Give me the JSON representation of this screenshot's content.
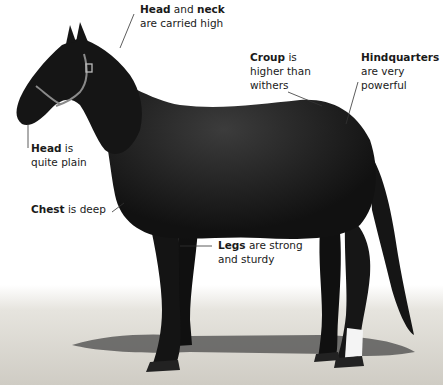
{
  "diagram": {
    "colors": {
      "background": "#ffffff",
      "horse": "#141414",
      "horse_highlight": "#3a3a3a",
      "ground": "#d8d6d0",
      "shadow": "#4a4a4a",
      "text": "#1a1a1a",
      "leader_line": "#333333",
      "white_sock": "#f4f4f4"
    },
    "labels": [
      {
        "id": "head-neck",
        "bold1": "Head",
        "mid": " and ",
        "bold2": "neck",
        "line2": "are carried high"
      },
      {
        "id": "croup",
        "bold1": "Croup",
        "mid": " is",
        "line2": "higher than",
        "line3": "withers"
      },
      {
        "id": "hindquarters",
        "bold1": "Hindquarters",
        "line2": "are very",
        "line3": "powerful"
      },
      {
        "id": "head",
        "bold1": "Head",
        "mid": " is",
        "line2": "quite plain"
      },
      {
        "id": "chest",
        "bold1": "Chest",
        "mid": " is deep"
      },
      {
        "id": "legs",
        "bold1": "Legs",
        "mid": " are strong",
        "line2": "and sturdy"
      }
    ]
  }
}
